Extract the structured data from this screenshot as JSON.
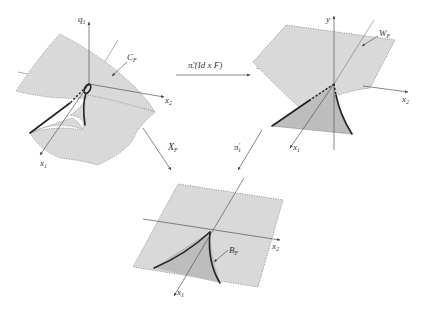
{
  "diagram": {
    "panels": {
      "top_left": {
        "name": "catastrophe manifold",
        "surface_label": "C",
        "surface_label_sub": "F",
        "axes": {
          "vertical": "q",
          "vertical_sub": "1",
          "right": "x",
          "right_sub": "2",
          "front": "x",
          "front_sub": "1"
        }
      },
      "top_right": {
        "name": "image surface",
        "surface_label": "W",
        "surface_label_sub": "F",
        "axes": {
          "vertical": "y",
          "right": "x",
          "right_sub": "2",
          "front": "x",
          "front_sub": "1"
        }
      },
      "bottom": {
        "name": "bifurcation set",
        "surface_label": "B",
        "surface_label_sub": "F",
        "axes": {
          "right": "x",
          "right_sub": "2",
          "front": "x",
          "front_sub": "1"
        }
      }
    },
    "maps": {
      "horizontal": {
        "label_main": "π̃.(Id x F)",
        "pi_glyph": "π̃.",
        "rest": "(Id x F)"
      },
      "diagonal_left": {
        "label": "X",
        "label_sub": "F"
      },
      "diagonal_right": {
        "label": "π",
        "label_sup": "′",
        "label_sub": "1"
      }
    },
    "colors": {
      "surface_fill": "#d9d9d9",
      "surface_shade": "#bdbdbd",
      "fold_curve": "#222222",
      "axis": "#555555"
    }
  }
}
